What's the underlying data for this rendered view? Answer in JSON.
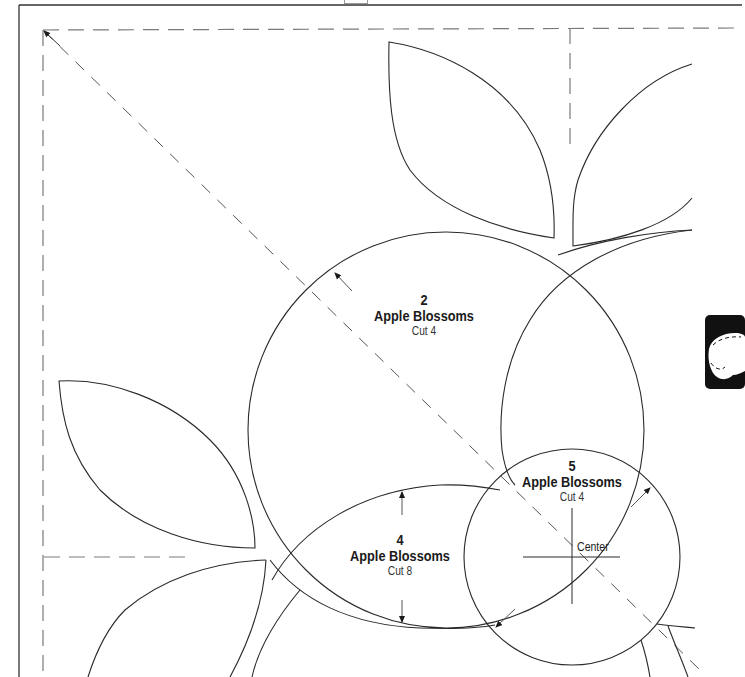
{
  "pattern": {
    "pieces": [
      {
        "number": "2",
        "name": "Apple Blossoms",
        "cut": "Cut 4"
      },
      {
        "number": "4",
        "name": "Apple Blossoms",
        "cut": "Cut 8"
      },
      {
        "number": "5",
        "name": "Apple Blossoms",
        "cut": "Cut 4",
        "center_label": "Center"
      }
    ]
  },
  "colors": {
    "line": "#2a2a2a",
    "dashed": "#7a7a7a",
    "thumb_tab": "#111111"
  },
  "icons": {
    "thumb_tab": "apple-blossom-section-tab-icon"
  }
}
